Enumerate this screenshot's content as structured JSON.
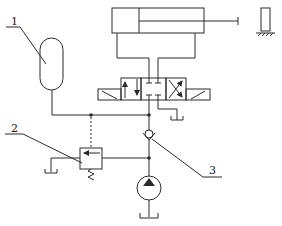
{
  "diagram": {
    "type": "hydraulic-circuit",
    "colors": {
      "line": "#2a2a2a",
      "background": "#ffffff"
    },
    "components": [
      {
        "id": "accumulator",
        "label": "1"
      },
      {
        "id": "relief-valve",
        "label": "2"
      },
      {
        "id": "check-valve",
        "label": "3"
      },
      {
        "id": "cylinder",
        "label": ""
      },
      {
        "id": "directional-valve",
        "label": ""
      },
      {
        "id": "pump",
        "label": ""
      },
      {
        "id": "wall-stop",
        "label": ""
      }
    ],
    "labels": {
      "one": "1",
      "two": "2",
      "three": "3"
    }
  }
}
